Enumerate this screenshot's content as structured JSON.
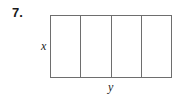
{
  "problem": {
    "number_label": "7."
  },
  "figure": {
    "shape": "rectangle",
    "divisions": 4,
    "cells": [
      {
        "index": 1
      },
      {
        "index": 2
      },
      {
        "index": 3
      },
      {
        "index": 4
      }
    ],
    "side_label": "x",
    "bottom_label": "y",
    "line_color": "#6e6e6e"
  }
}
